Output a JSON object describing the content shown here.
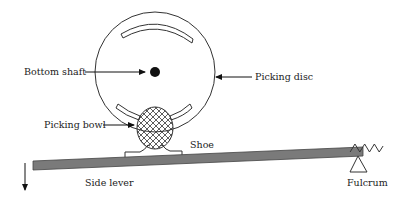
{
  "diagram": {
    "type": "mechanism",
    "labels": {
      "bottom_shaft": "Bottom shaft",
      "picking_disc": "Picking disc",
      "picking_bowl": "Picking bowl",
      "shoe": "Shoe",
      "side_lever": "Side lever",
      "fulcrum": "Fulcrum"
    },
    "components": [
      {
        "id": "picking-disc",
        "label": "Picking disc",
        "shape": "circle with two curved slots"
      },
      {
        "id": "bottom-shaft",
        "label": "Bottom shaft",
        "shape": "filled dot at disc center"
      },
      {
        "id": "picking-bowl",
        "label": "Picking bowl",
        "shape": "cross-hatched ellipse"
      },
      {
        "id": "shoe",
        "label": "Shoe",
        "shape": "saddle support under bowl"
      },
      {
        "id": "side-lever",
        "label": "Side lever",
        "shape": "inclined gray bar"
      },
      {
        "id": "fulcrum",
        "label": "Fulcrum",
        "shape": "triangle pivot at right end"
      },
      {
        "id": "return-spring",
        "label": "",
        "shape": "zig-zag spring with anchor circle"
      },
      {
        "id": "motion-arrow",
        "label": "",
        "shape": "downward arrow at left end of lever"
      }
    ],
    "colors": {
      "line": "#333333",
      "lever_fill": "#7a7a7a",
      "background": "#ffffff"
    }
  }
}
